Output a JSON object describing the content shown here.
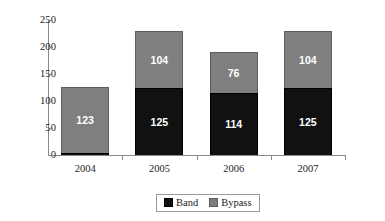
{
  "chart_data": {
    "type": "bar",
    "subtype": "stacked-bar",
    "title": "",
    "subtitle": "",
    "xlabel": "",
    "ylabel": "",
    "categories": [
      "2004",
      "2005",
      "2006",
      "2007"
    ],
    "series": [
      {
        "name": "Band",
        "color": "#111111",
        "values": [
          3,
          125,
          114,
          125
        ]
      },
      {
        "name": "Bypass",
        "color": "#7f7f7f",
        "values": [
          123,
          104,
          76,
          104
        ]
      }
    ],
    "totals": [
      126,
      229,
      190,
      229
    ],
    "ylim": [
      0,
      250
    ],
    "ytick_step": 50,
    "yticks": [
      "0",
      "50",
      "100",
      "150",
      "200",
      "250"
    ],
    "grid": false,
    "legend_position": "bottom-center",
    "data_labels": true
  },
  "legend": {
    "items": [
      {
        "label": "Band",
        "swatch": "black-square-swatch"
      },
      {
        "label": "Bypass",
        "swatch": "gray-square-swatch"
      }
    ]
  }
}
